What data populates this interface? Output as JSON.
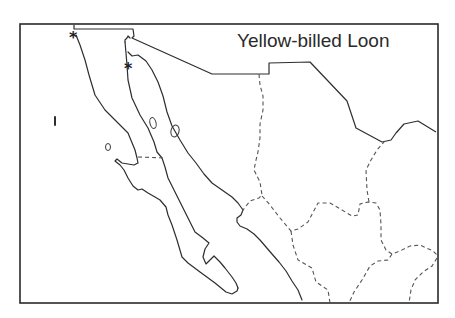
{
  "map": {
    "title": "Yellow-billed Loon",
    "region": "Northwestern Mexico",
    "legend": [],
    "markers": [
      {
        "symbol": "*",
        "x": 75,
        "y": 40
      },
      {
        "symbol": "*",
        "x": 130,
        "y": 71
      }
    ],
    "colors": {
      "background": "#ffffff",
      "lines": "#2e2e2e",
      "state_borders": "#555555"
    }
  }
}
